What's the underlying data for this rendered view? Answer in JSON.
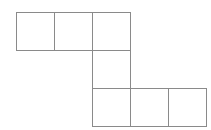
{
  "figure": {
    "kind": "polyomino-net",
    "title": "Hexomino net of six unit squares",
    "square_count": 6,
    "row_count": 3,
    "column_count": 5,
    "cell_size_px": 38,
    "line_color": "#8a8a8a",
    "fill_color": "#ffffff",
    "background_color": "#ffffff",
    "stroke_width_px": 1.15,
    "origin": {
      "x": 16,
      "y": 12
    },
    "labels": [],
    "annotations": [],
    "cells": [
      {
        "name": "top-left-square",
        "col": 0,
        "row": 0,
        "x": 16,
        "y": 12
      },
      {
        "name": "top-middle-square",
        "col": 1,
        "row": 0,
        "x": 54,
        "y": 12
      },
      {
        "name": "top-right-square",
        "col": 2,
        "row": 0,
        "x": 92,
        "y": 12
      },
      {
        "name": "connector-square",
        "col": 2,
        "row": 1,
        "x": 92,
        "y": 50
      },
      {
        "name": "bottom-left-square",
        "col": 2,
        "row": 2,
        "x": 92,
        "y": 88
      },
      {
        "name": "bottom-mid-square",
        "col": 3,
        "row": 2,
        "x": 130,
        "y": 88
      },
      {
        "name": "bottom-right-square",
        "col": 4,
        "row": 2,
        "x": 168,
        "y": 88
      }
    ]
  }
}
